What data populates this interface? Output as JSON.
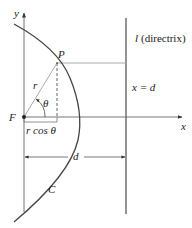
{
  "diagram": {
    "labels": {
      "y_axis": "y",
      "x_axis": "x",
      "focus": "F",
      "point": "P",
      "radius": "r",
      "angle": "θ",
      "projection": "r cos θ",
      "distance": "d",
      "curve": "C",
      "directrix_letter": "l",
      "directrix_word": "(directrix)",
      "directrix_eq": "x = d"
    },
    "colors": {
      "stroke": "#555555",
      "curve": "#444444",
      "text": "#222222"
    }
  }
}
